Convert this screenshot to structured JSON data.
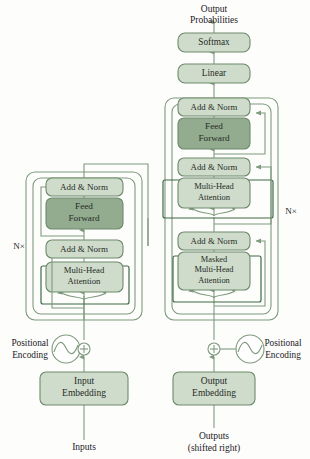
{
  "diagram": {
    "colors": {
      "box_light_fill": "#cfdccb",
      "box_dark_fill": "#93ab8f",
      "box_stroke": "#6d8a6b",
      "line_stroke": "#7f9a7c",
      "attention_wrap_stroke": "#3f6b45",
      "text": "#262b26",
      "background": "#fdfdfc"
    },
    "free_labels": {
      "output_probabilities_line1": "Output",
      "output_probabilities_line2": "Probabilities",
      "inputs": "Inputs",
      "outputs_line1": "Outputs",
      "outputs_line2": "(shifted right)",
      "positional_encoding_left_line1": "Positional",
      "positional_encoding_left_line2": "Encoding",
      "positional_encoding_right_line1": "Positional",
      "positional_encoding_right_line2": "Encoding",
      "n_times_left": "N×",
      "n_times_right": "N×"
    },
    "boxes": {
      "softmax": {
        "label": "Softmax",
        "shade": "light"
      },
      "linear": {
        "label": "Linear",
        "shade": "light"
      },
      "decoder_add_norm_top": {
        "label": "Add & Norm",
        "shade": "light"
      },
      "decoder_feed_forward": {
        "label_line1": "Feed",
        "label_line2": "Forward",
        "shade": "dark"
      },
      "decoder_add_norm_mid": {
        "label": "Add & Norm",
        "shade": "light"
      },
      "decoder_cross_attention": {
        "label_line1": "Multi-Head",
        "label_line2": "Attention",
        "shade": "light"
      },
      "decoder_add_norm_bottom": {
        "label": "Add & Norm",
        "shade": "light"
      },
      "decoder_masked_attention": {
        "label_line1": "Masked",
        "label_line2": "Multi-Head",
        "label_line3": "Attention",
        "shade": "light"
      },
      "output_embedding": {
        "label_line1": "Output",
        "label_line2": "Embedding",
        "shade": "light"
      },
      "encoder_add_norm_top": {
        "label": "Add & Norm",
        "shade": "light"
      },
      "encoder_feed_forward": {
        "label_line1": "Feed",
        "label_line2": "Forward",
        "shade": "dark"
      },
      "encoder_add_norm_bottom": {
        "label": "Add & Norm",
        "shade": "light"
      },
      "encoder_self_attention": {
        "label_line1": "Multi-Head",
        "label_line2": "Attention",
        "shade": "light"
      },
      "input_embedding": {
        "label_line1": "Input",
        "label_line2": "Embedding",
        "shade": "light"
      }
    }
  }
}
